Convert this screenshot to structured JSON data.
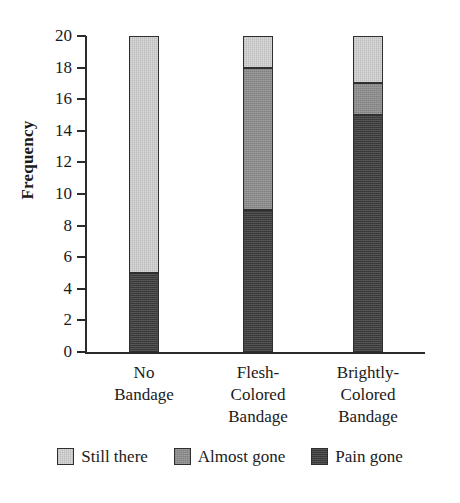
{
  "chart_data": {
    "type": "bar",
    "stacked": true,
    "title": "",
    "xlabel": "",
    "ylabel": "Frequency",
    "ylim": [
      0,
      20
    ],
    "ytick_step": 2,
    "yticks": [
      20,
      18,
      16,
      14,
      12,
      10,
      8,
      6,
      4,
      2,
      0
    ],
    "grid": false,
    "legend_position": "bottom",
    "categories": [
      {
        "lines": [
          "No",
          "Bandage"
        ]
      },
      {
        "lines": [
          "Flesh-",
          "Colored",
          "Bandage"
        ]
      },
      {
        "lines": [
          "Brightly-",
          "Colored",
          "Bandage"
        ]
      }
    ],
    "category_labels": [
      "No Bandage",
      "Flesh-Colored Bandage",
      "Brightly-Colored Bandage"
    ],
    "series": [
      {
        "name": "Pain gone",
        "key": "pain",
        "color": "#3c3c3c",
        "values": [
          5,
          9,
          15
        ]
      },
      {
        "name": "Almost gone",
        "key": "almost",
        "color": "#8c8c8c",
        "values": [
          0,
          9,
          2
        ]
      },
      {
        "name": "Still there",
        "key": "still",
        "color": "#d0d0d0",
        "values": [
          15,
          2,
          3
        ]
      }
    ],
    "legend": [
      {
        "label": "Still there",
        "color": "#d0d0d0"
      },
      {
        "label": "Almost gone",
        "color": "#8c8c8c"
      },
      {
        "label": "Pain gone",
        "color": "#3c3c3c"
      }
    ],
    "stack_boundaries": [
      {
        "category": "No Bandage",
        "pain_gone": [
          0,
          5
        ],
        "almost_gone": [
          5,
          5
        ],
        "still_there": [
          5,
          20
        ]
      },
      {
        "category": "Flesh-Colored Bandage",
        "pain_gone": [
          0,
          9
        ],
        "almost_gone": [
          9,
          18
        ],
        "still_there": [
          18,
          20
        ]
      },
      {
        "category": "Brightly-Colored Bandage",
        "pain_gone": [
          0,
          15
        ],
        "almost_gone": [
          15,
          17
        ],
        "still_there": [
          17,
          20
        ]
      }
    ],
    "totals": [
      20,
      20,
      20
    ]
  }
}
